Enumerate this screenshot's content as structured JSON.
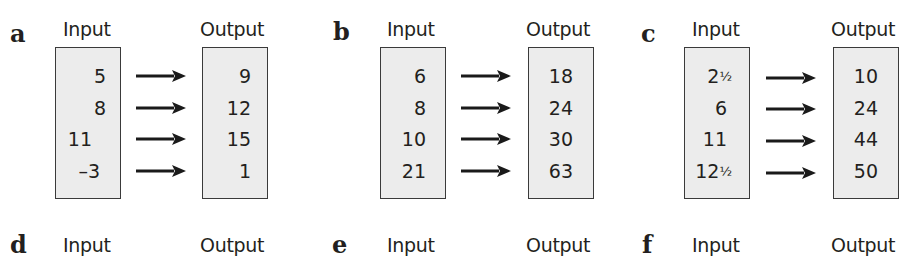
{
  "exercises": [
    {
      "letter": "a",
      "input_label": "Input",
      "output_label": "Output",
      "rows": [
        {
          "input": "5",
          "output": "9"
        },
        {
          "input": "8",
          "output": "12"
        },
        {
          "input": "11",
          "output": "15"
        },
        {
          "input": "–3",
          "output": "1"
        }
      ]
    },
    {
      "letter": "b",
      "input_label": "Input",
      "output_label": "Output",
      "rows": [
        {
          "input": "6",
          "output": "18"
        },
        {
          "input": "8",
          "output": "24"
        },
        {
          "input": "10",
          "output": "30"
        },
        {
          "input": "21",
          "output": "63"
        }
      ]
    },
    {
      "letter": "c",
      "input_label": "Input",
      "output_label": "Output",
      "rows": [
        {
          "input_whole": "2",
          "input_frac": "1/2",
          "output": "10"
        },
        {
          "input": "6",
          "output": "24"
        },
        {
          "input": "11",
          "output": "44"
        },
        {
          "input_whole": "12",
          "input_frac": "1/2",
          "output": "50"
        }
      ]
    },
    {
      "letter": "d",
      "input_label": "Input",
      "output_label": "Output"
    },
    {
      "letter": "e",
      "input_label": "Input",
      "output_label": "Output"
    },
    {
      "letter": "f",
      "input_label": "Input",
      "output_label": "Output"
    }
  ],
  "colors": {
    "box_fill": "#ececec",
    "box_border": "#3a3a3a",
    "text": "#231f20",
    "arrow": "#1a1a1a"
  },
  "icons": {
    "arrow": "right-arrow-icon"
  }
}
